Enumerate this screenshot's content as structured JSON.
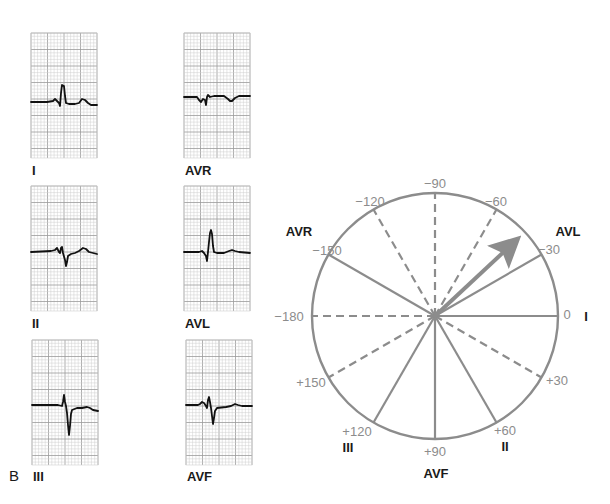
{
  "panel_label": "B",
  "colors": {
    "grid_minor": "#cfcfcf",
    "grid_major": "#9a9a9a",
    "trace": "#111111",
    "axis": "#8c8c8c",
    "text": "#1a1a1a"
  },
  "ecg_strips": [
    {
      "lead": "I",
      "x": 31,
      "y": 33,
      "w": 66,
      "h": 125,
      "label_y": 175,
      "trace": "0,69 16,69 22,68 24,66 26,68 28,70 29,73 30,60 31,52 33,53 34,63 35,70 38,71 44,71 48,70 51,66 54,67 57,70 60,72 66,72"
    },
    {
      "lead": "AVR",
      "x": 184,
      "y": 33,
      "w": 66,
      "h": 125,
      "label_y": 175,
      "trace": "0,64 13,64 15,67 17,69 19,66 21,67 22,72 23,64 24,62 25,63 26,64 30,63 40,63 44,66 46,68 48,68 51,65 55,63 66,63"
    },
    {
      "lead": "II",
      "x": 31,
      "y": 186,
      "w": 66,
      "h": 125,
      "label_y": 328,
      "trace": "0,66 20,65 24,64 26,62 27,64 28,66 29,67 30,62 31,61 32,67 34,74 35,80 36,76 37,70 40,68 44,67 48,65 52,62 55,63 58,66 66,68"
    },
    {
      "lead": "AVL",
      "x": 184,
      "y": 186,
      "w": 66,
      "h": 125,
      "label_y": 328,
      "trace": "0,66 15,66 18,65 20,67 22,70 23,75 24,66 25,56 26,47 27,44 28,48 29,60 30,66 33,67 40,67 45,65 48,64 51,65 55,66 66,67"
    },
    {
      "lead": "III",
      "x": 32,
      "y": 340,
      "w": 66,
      "h": 125,
      "label_y": 481,
      "trace": "0,65 20,65 26,65 30,66 31,62 32,55 33,62 34,66 35,73 36,85 37,95 38,86 39,74 40,70 45,68 50,68 55,67 58,68 61,70 66,71"
    },
    {
      "lead": "AVF",
      "x": 186,
      "y": 340,
      "w": 66,
      "h": 125,
      "label_y": 481,
      "trace": "0,65 12,65 14,64 16,62 18,63 20,66 21,68 22,60 23,57 24,62 25,68 26,76 27,84 28,78 29,71 31,68 40,67 45,66 49,64 52,65 56,66 66,66"
    }
  ],
  "hexaxial": {
    "center": [
      435,
      316
    ],
    "radius": 123,
    "axes": [
      {
        "angle": 0,
        "style": "solid"
      },
      {
        "angle": -30,
        "style": "solid"
      },
      {
        "angle": -60,
        "style": "dashed"
      },
      {
        "angle": -90,
        "style": "dashed"
      },
      {
        "angle": -120,
        "style": "dashed"
      },
      {
        "angle": -150,
        "style": "solid"
      },
      {
        "angle": -180,
        "style": "dashed"
      },
      {
        "angle": 30,
        "style": "dashed"
      },
      {
        "angle": 60,
        "style": "solid"
      },
      {
        "angle": 90,
        "style": "solid"
      },
      {
        "angle": 120,
        "style": "solid"
      },
      {
        "angle": 150,
        "style": "dashed"
      }
    ],
    "degree_labels": [
      {
        "text": "−90",
        "x": 435,
        "y": 188,
        "anchor": "middle"
      },
      {
        "text": "−120",
        "x": 370,
        "y": 206,
        "anchor": "middle"
      },
      {
        "text": "−60",
        "x": 496,
        "y": 206,
        "anchor": "middle"
      },
      {
        "text": "−150",
        "x": 327,
        "y": 255,
        "anchor": "middle"
      },
      {
        "text": "−30",
        "x": 549,
        "y": 254,
        "anchor": "middle"
      },
      {
        "text": "−180",
        "x": 289,
        "y": 321,
        "anchor": "middle"
      },
      {
        "text": "0",
        "x": 567,
        "y": 319,
        "anchor": "middle"
      },
      {
        "text": "+150",
        "x": 311,
        "y": 387,
        "anchor": "middle"
      },
      {
        "text": "+30",
        "x": 557,
        "y": 385,
        "anchor": "middle"
      },
      {
        "text": "+120",
        "x": 357,
        "y": 436,
        "anchor": "middle"
      },
      {
        "text": "+60",
        "x": 505,
        "y": 435,
        "anchor": "middle"
      },
      {
        "text": "+90",
        "x": 435,
        "y": 456,
        "anchor": "middle"
      }
    ],
    "lead_labels": [
      {
        "text": "AVR",
        "x": 299,
        "y": 236,
        "anchor": "middle"
      },
      {
        "text": "AVL",
        "x": 568,
        "y": 236,
        "anchor": "middle"
      },
      {
        "text": "I",
        "x": 586,
        "y": 321,
        "anchor": "middle"
      },
      {
        "text": "III",
        "x": 348,
        "y": 452,
        "anchor": "middle"
      },
      {
        "text": "II",
        "x": 505,
        "y": 451,
        "anchor": "middle"
      },
      {
        "text": "AVF",
        "x": 436,
        "y": 478,
        "anchor": "middle"
      }
    ],
    "mean_axis_vector": {
      "angle": -43,
      "length": 120
    }
  }
}
